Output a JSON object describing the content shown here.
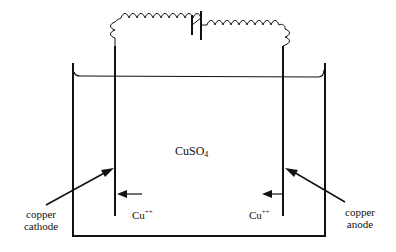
{
  "diagram": {
    "solution": {
      "formula": "CuSO",
      "subscript": "4"
    },
    "ion_left": {
      "base": "Cu",
      "charge": "++"
    },
    "ion_right": {
      "base": "Cu",
      "charge": "++"
    },
    "cathode_label": {
      "line1": "copper",
      "line2": "cathode"
    },
    "anode_label": {
      "line1": "copper",
      "line2": "anode"
    },
    "components": [
      "battery",
      "coiled-wire-left",
      "coiled-wire-right",
      "tank",
      "electrolyte-surface",
      "cathode-electrode",
      "anode-electrode"
    ],
    "colors": {
      "ink": "#111111",
      "background": "#ffffff"
    }
  }
}
